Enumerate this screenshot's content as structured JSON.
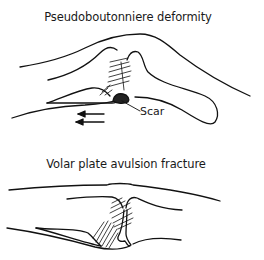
{
  "figure_top": {
    "title": "Pseudoboutonniere deformity",
    "labels": {
      "scar": "Scar"
    },
    "annotations": [
      "two leftward arrows indicating proximal pull"
    ]
  },
  "figure_bottom": {
    "title": "Volar plate avulsion fracture"
  },
  "colors": {
    "ink": "#111111",
    "background": "#ffffff"
  }
}
